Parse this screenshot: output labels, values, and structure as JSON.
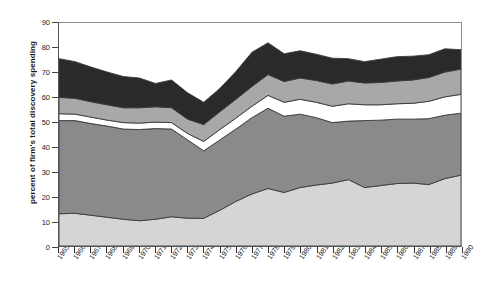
{
  "chart_data": {
    "type": "area",
    "title": "",
    "xlabel": "",
    "ylabel": "percent of firm's total discovery spending",
    "ylim": [
      0,
      90
    ],
    "ytick_step": 10,
    "yticks": [
      0,
      10,
      20,
      30,
      40,
      50,
      60,
      70,
      80,
      90
    ],
    "grid": false,
    "legend": "none",
    "stacked": true,
    "categories": [
      "1965",
      "1966",
      "1967",
      "1968",
      "1969",
      "1970",
      "1971",
      "1972",
      "1973",
      "1974",
      "1975",
      "1976",
      "1977",
      "1978",
      "1979",
      "1980",
      "1981",
      "1982",
      "1983",
      "1984",
      "1985",
      "1986",
      "1987",
      "1988",
      "1989",
      "1990"
    ],
    "series": [
      {
        "name": "band-1-light-gray",
        "color": "#d5d5d5",
        "values": [
          13.0,
          13.2,
          12.4,
          11.6,
          10.8,
          10.2,
          10.8,
          11.8,
          11.2,
          11.2,
          14.4,
          18.0,
          21.0,
          23.2,
          21.6,
          23.6,
          24.6,
          25.4,
          26.8,
          23.6,
          24.4,
          25.2,
          25.4,
          24.8,
          27.2,
          28.6
        ]
      },
      {
        "name": "band-2-medium-dark-gray",
        "color": "#8a8a8a",
        "values": [
          37.6,
          37.4,
          37.0,
          36.8,
          36.4,
          36.8,
          36.6,
          35.4,
          31.6,
          27.2,
          28.4,
          29.2,
          30.8,
          32.4,
          30.8,
          29.6,
          27.2,
          24.4,
          23.6,
          27.0,
          26.4,
          26.0,
          25.8,
          26.6,
          25.6,
          25.0
        ]
      },
      {
        "name": "band-3-white",
        "color": "#ffffff",
        "values": [
          2.8,
          2.6,
          2.6,
          2.4,
          2.6,
          2.6,
          2.6,
          2.6,
          2.6,
          3.8,
          4.2,
          4.4,
          4.6,
          5.2,
          5.6,
          6.0,
          6.2,
          6.6,
          7.0,
          6.4,
          6.2,
          6.2,
          6.4,
          7.0,
          7.4,
          7.6
        ]
      },
      {
        "name": "band-4-medium-gray",
        "color": "#a8a8a8",
        "values": [
          6.6,
          6.4,
          6.2,
          6.2,
          6.0,
          6.2,
          6.2,
          6.0,
          5.8,
          6.8,
          7.2,
          7.6,
          8.0,
          8.4,
          8.4,
          8.6,
          8.8,
          9.0,
          9.2,
          8.8,
          9.0,
          9.2,
          9.4,
          9.6,
          10.0,
          10.2
        ]
      },
      {
        "name": "band-5-dark",
        "color": "#2a2a2a",
        "values": [
          15.6,
          14.8,
          14.0,
          13.2,
          12.6,
          12.0,
          9.4,
          11.2,
          10.6,
          9.0,
          9.4,
          11.2,
          13.8,
          12.8,
          11.2,
          11.0,
          10.6,
          10.4,
          9.0,
          8.6,
          9.4,
          9.8,
          9.6,
          9.2,
          9.4,
          7.8
        ]
      }
    ]
  }
}
